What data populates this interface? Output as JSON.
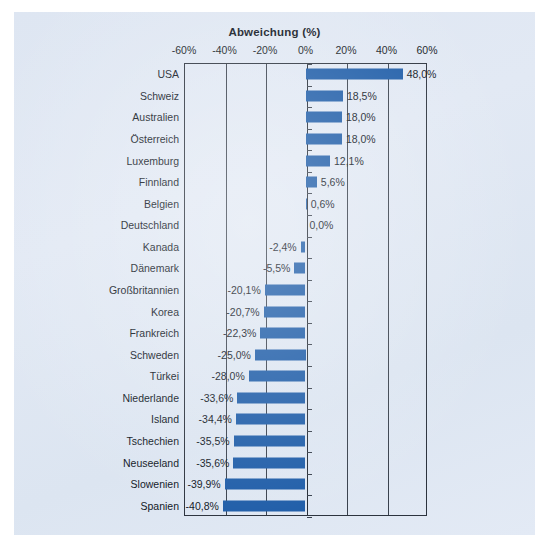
{
  "chart_data": {
    "type": "bar",
    "orientation": "horizontal",
    "title": "Abweichung (%)",
    "xlabel": "Abweichung (%)",
    "ylabel": "",
    "xlim": [
      -60,
      60
    ],
    "xticks": [
      -60,
      -40,
      -20,
      0,
      20,
      40,
      60
    ],
    "xtick_labels": [
      "-60%",
      "-40%",
      "-20%",
      "0%",
      "20%",
      "40%",
      "60%"
    ],
    "grid": true,
    "legend": "none",
    "bar_color": "#1F5DA8",
    "categories": [
      "USA",
      "Schweiz",
      "Australien",
      "Österreich",
      "Luxemburg",
      "Finnland",
      "Belgien",
      "Deutschland",
      "Kanada",
      "Dänemark",
      "Großbritannien",
      "Korea",
      "Frankreich",
      "Schweden",
      "Türkei",
      "Niederlande",
      "Island",
      "Tschechien",
      "Neuseeland",
      "Slowenien",
      "Spanien"
    ],
    "values": [
      48.0,
      18.5,
      18.0,
      18.0,
      12.1,
      5.6,
      0.6,
      0.0,
      -2.4,
      -5.5,
      -20.1,
      -20.7,
      -22.3,
      -25.0,
      -28.0,
      -33.6,
      -34.4,
      -35.5,
      -35.6,
      -39.9,
      -40.8
    ],
    "value_labels": [
      "48,0%",
      "18,5%",
      "18,0%",
      "18,0%",
      "12,1%",
      "5,6%",
      "0,6%",
      "0,0%",
      "-2,4%",
      "-5,5%",
      "-20,1%",
      "-20,7%",
      "-22,3%",
      "-25,0%",
      "-28,0%",
      "-33,6%",
      "-34,4%",
      "-35,5%",
      "-35,6%",
      "-39,9%",
      "-40,8%"
    ]
  },
  "caption": ""
}
